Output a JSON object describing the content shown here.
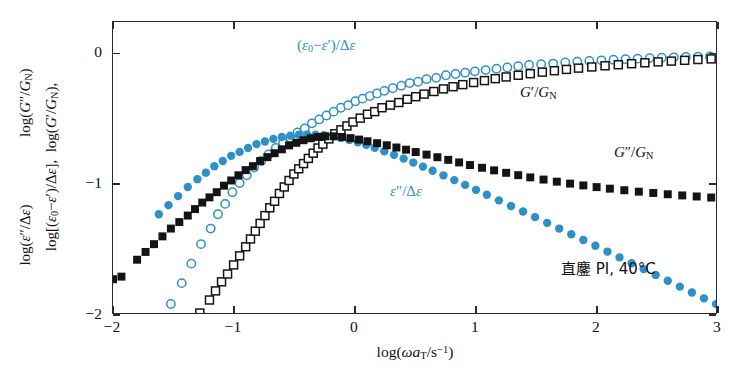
{
  "figure": {
    "background": "#ffffff",
    "accent_blue": "#2e90c8",
    "accent_black": "#141414"
  },
  "axes": {
    "x": {
      "title_html": "log(&#969;<i>a</i><sub>T</sub>/s<sup>&#8722;1</sup>)",
      "title_text": "log(ωa_T/s^-1)",
      "ticks": [
        "-2",
        "-1",
        "0",
        "1",
        "2",
        "3"
      ],
      "tick_values": [
        -2,
        -1,
        0,
        1,
        2,
        3
      ],
      "min": -2,
      "max": 3
    },
    "y": {
      "line1_text": "log[(ε₀−ε′)/Δε],  log(G′/G_N)",
      "line2_text": "log(ε″/Δε),  log(G″/G_N)",
      "ticks": [
        "0",
        "-1",
        "-2"
      ],
      "tick_values": [
        0,
        -1,
        -2
      ],
      "min": -2,
      "max": 0.24
    }
  },
  "annotations": {
    "eps_real": "(ε₀−ε′)/Δε",
    "eps_imag": "ε″/Δε",
    "g_prime": "G′/G_N",
    "g_dprime": "G″/G_N",
    "sample": "直鏖 PI, 40°C"
  },
  "chart_data": {
    "type": "scatter",
    "title": "",
    "xlabel": "log(ωa_T/s^-1)",
    "ylabel": "log[(ε₀−ε′)/Δε], log(G′/G_N), log(ε″/Δε), log(G″/G_N)",
    "xlim": [
      -2,
      3
    ],
    "ylim": [
      -2,
      0.24
    ],
    "grid": false,
    "legend": "inline-annotations",
    "marker_px": 8,
    "series": [
      {
        "name": "(ε₀−ε′)/Δε",
        "label": "eps-real",
        "marker": "open-circle",
        "color": "#2e90c8",
        "points": [
          [
            -1.52,
            -1.93
          ],
          [
            -1.43,
            -1.77
          ],
          [
            -1.35,
            -1.62
          ],
          [
            -1.27,
            -1.47
          ],
          [
            -1.19,
            -1.35
          ],
          [
            -1.13,
            -1.24
          ],
          [
            -1.07,
            -1.16
          ],
          [
            -1.01,
            -1.07
          ],
          [
            -0.95,
            -1.0
          ],
          [
            -0.89,
            -0.94
          ],
          [
            -0.83,
            -0.88
          ],
          [
            -0.77,
            -0.83
          ],
          [
            -0.71,
            -0.78
          ],
          [
            -0.65,
            -0.73
          ],
          [
            -0.59,
            -0.69
          ],
          [
            -0.53,
            -0.65
          ],
          [
            -0.47,
            -0.61
          ],
          [
            -0.41,
            -0.58
          ],
          [
            -0.35,
            -0.54
          ],
          [
            -0.29,
            -0.51
          ],
          [
            -0.23,
            -0.48
          ],
          [
            -0.17,
            -0.45
          ],
          [
            -0.11,
            -0.42
          ],
          [
            -0.05,
            -0.4
          ],
          [
            0.01,
            -0.37
          ],
          [
            0.07,
            -0.35
          ],
          [
            0.13,
            -0.33
          ],
          [
            0.19,
            -0.31
          ],
          [
            0.25,
            -0.29
          ],
          [
            0.32,
            -0.27
          ],
          [
            0.39,
            -0.25
          ],
          [
            0.46,
            -0.23
          ],
          [
            0.53,
            -0.22
          ],
          [
            0.6,
            -0.2
          ],
          [
            0.68,
            -0.19
          ],
          [
            0.76,
            -0.17
          ],
          [
            0.84,
            -0.16
          ],
          [
            0.92,
            -0.15
          ],
          [
            1.0,
            -0.14
          ],
          [
            1.09,
            -0.13
          ],
          [
            1.18,
            -0.12
          ],
          [
            1.27,
            -0.11
          ],
          [
            1.36,
            -0.1
          ],
          [
            1.45,
            -0.09
          ],
          [
            1.55,
            -0.085
          ],
          [
            1.65,
            -0.08
          ],
          [
            1.75,
            -0.072
          ],
          [
            1.85,
            -0.066
          ],
          [
            1.95,
            -0.06
          ],
          [
            2.05,
            -0.055
          ],
          [
            2.15,
            -0.05
          ],
          [
            2.25,
            -0.046
          ],
          [
            2.35,
            -0.042
          ],
          [
            2.45,
            -0.038
          ],
          [
            2.55,
            -0.035
          ],
          [
            2.65,
            -0.032
          ],
          [
            2.75,
            -0.029
          ],
          [
            2.85,
            -0.027
          ],
          [
            2.95,
            -0.025
          ]
        ]
      },
      {
        "name": "ε″/Δε",
        "label": "eps-imag",
        "marker": "filled-circle",
        "color": "#2e90c8",
        "points": [
          [
            -1.62,
            -1.24
          ],
          [
            -1.54,
            -1.17
          ],
          [
            -1.46,
            -1.1
          ],
          [
            -1.38,
            -1.03
          ],
          [
            -1.3,
            -0.97
          ],
          [
            -1.23,
            -0.92
          ],
          [
            -1.16,
            -0.87
          ],
          [
            -1.09,
            -0.83
          ],
          [
            -1.02,
            -0.79
          ],
          [
            -0.95,
            -0.76
          ],
          [
            -0.88,
            -0.73
          ],
          [
            -0.81,
            -0.7
          ],
          [
            -0.74,
            -0.68
          ],
          [
            -0.67,
            -0.66
          ],
          [
            -0.6,
            -0.645
          ],
          [
            -0.53,
            -0.635
          ],
          [
            -0.46,
            -0.628
          ],
          [
            -0.39,
            -0.625
          ],
          [
            -0.32,
            -0.627
          ],
          [
            -0.25,
            -0.632
          ],
          [
            -0.18,
            -0.641
          ],
          [
            -0.11,
            -0.653
          ],
          [
            -0.04,
            -0.668
          ],
          [
            0.03,
            -0.686
          ],
          [
            0.1,
            -0.706
          ],
          [
            0.17,
            -0.728
          ],
          [
            0.25,
            -0.755
          ],
          [
            0.33,
            -0.783
          ],
          [
            0.41,
            -0.812
          ],
          [
            0.49,
            -0.842
          ],
          [
            0.57,
            -0.873
          ],
          [
            0.65,
            -0.905
          ],
          [
            0.74,
            -0.94
          ],
          [
            0.83,
            -0.977
          ],
          [
            0.92,
            -1.014
          ],
          [
            1.01,
            -1.052
          ],
          [
            1.1,
            -1.09
          ],
          [
            1.2,
            -1.133
          ],
          [
            1.3,
            -1.176
          ],
          [
            1.4,
            -1.219
          ],
          [
            1.5,
            -1.262
          ],
          [
            1.6,
            -1.306
          ],
          [
            1.7,
            -1.35
          ],
          [
            1.8,
            -1.394
          ],
          [
            1.9,
            -1.438
          ],
          [
            2.0,
            -1.482
          ],
          [
            2.1,
            -1.527
          ],
          [
            2.2,
            -1.572
          ],
          [
            2.3,
            -1.617
          ],
          [
            2.4,
            -1.662
          ],
          [
            2.5,
            -1.707
          ],
          [
            2.6,
            -1.752
          ],
          [
            2.7,
            -1.797
          ],
          [
            2.8,
            -1.842
          ],
          [
            2.9,
            -1.887
          ],
          [
            3.0,
            -1.932
          ]
        ]
      },
      {
        "name": "G′/G_N",
        "label": "g-prime",
        "marker": "open-square",
        "color": "#141414",
        "points": [
          [
            -1.28,
            -2.0
          ],
          [
            -1.2,
            -1.9
          ],
          [
            -1.15,
            -1.83
          ],
          [
            -1.1,
            -1.76
          ],
          [
            -1.05,
            -1.7
          ],
          [
            -1.0,
            -1.63
          ],
          [
            -0.95,
            -1.56
          ],
          [
            -0.9,
            -1.49
          ],
          [
            -0.86,
            -1.43
          ],
          [
            -0.82,
            -1.37
          ],
          [
            -0.78,
            -1.31
          ],
          [
            -0.74,
            -1.25
          ],
          [
            -0.7,
            -1.19
          ],
          [
            -0.66,
            -1.14
          ],
          [
            -0.62,
            -1.08
          ],
          [
            -0.58,
            -1.03
          ],
          [
            -0.54,
            -0.98
          ],
          [
            -0.5,
            -0.93
          ],
          [
            -0.46,
            -0.89
          ],
          [
            -0.42,
            -0.85
          ],
          [
            -0.38,
            -0.81
          ],
          [
            -0.34,
            -0.77
          ],
          [
            -0.3,
            -0.73
          ],
          [
            -0.26,
            -0.7
          ],
          [
            -0.21,
            -0.66
          ],
          [
            -0.16,
            -0.62
          ],
          [
            -0.11,
            -0.59
          ],
          [
            -0.06,
            -0.56
          ],
          [
            -0.01,
            -0.53
          ],
          [
            0.05,
            -0.5
          ],
          [
            0.11,
            -0.47
          ],
          [
            0.17,
            -0.45
          ],
          [
            0.23,
            -0.42
          ],
          [
            0.3,
            -0.4
          ],
          [
            0.37,
            -0.38
          ],
          [
            0.44,
            -0.355
          ],
          [
            0.51,
            -0.335
          ],
          [
            0.58,
            -0.315
          ],
          [
            0.66,
            -0.295
          ],
          [
            0.74,
            -0.275
          ],
          [
            0.82,
            -0.258
          ],
          [
            0.9,
            -0.242
          ],
          [
            0.99,
            -0.226
          ],
          [
            1.08,
            -0.211
          ],
          [
            1.17,
            -0.196
          ],
          [
            1.26,
            -0.183
          ],
          [
            1.36,
            -0.17
          ],
          [
            1.46,
            -0.158
          ],
          [
            1.56,
            -0.146
          ],
          [
            1.66,
            -0.135
          ],
          [
            1.76,
            -0.125
          ],
          [
            1.86,
            -0.115
          ],
          [
            1.97,
            -0.106
          ],
          [
            2.08,
            -0.097
          ],
          [
            2.19,
            -0.089
          ],
          [
            2.3,
            -0.081
          ],
          [
            2.41,
            -0.074
          ],
          [
            2.52,
            -0.067
          ],
          [
            2.63,
            -0.061
          ],
          [
            2.74,
            -0.055
          ],
          [
            2.85,
            -0.049
          ],
          [
            2.96,
            -0.044
          ]
        ]
      },
      {
        "name": "G″/G_N",
        "label": "g-dprime",
        "marker": "filled-square",
        "color": "#141414",
        "points": [
          [
            -2.0,
            -1.74
          ],
          [
            -1.93,
            -1.72
          ],
          [
            -1.8,
            -1.59
          ],
          [
            -1.73,
            -1.53
          ],
          [
            -1.66,
            -1.47
          ],
          [
            -1.59,
            -1.41
          ],
          [
            -1.52,
            -1.35
          ],
          [
            -1.45,
            -1.3
          ],
          [
            -1.38,
            -1.25
          ],
          [
            -1.32,
            -1.2
          ],
          [
            -1.26,
            -1.15
          ],
          [
            -1.2,
            -1.11
          ],
          [
            -1.14,
            -1.07
          ],
          [
            -1.08,
            -1.02
          ],
          [
            -1.02,
            -0.98
          ],
          [
            -0.96,
            -0.94
          ],
          [
            -0.9,
            -0.9
          ],
          [
            -0.84,
            -0.87
          ],
          [
            -0.78,
            -0.83
          ],
          [
            -0.72,
            -0.8
          ],
          [
            -0.66,
            -0.77
          ],
          [
            -0.6,
            -0.74
          ],
          [
            -0.54,
            -0.71
          ],
          [
            -0.48,
            -0.69
          ],
          [
            -0.42,
            -0.67
          ],
          [
            -0.36,
            -0.655
          ],
          [
            -0.3,
            -0.645
          ],
          [
            -0.24,
            -0.64
          ],
          [
            -0.17,
            -0.64
          ],
          [
            -0.1,
            -0.645
          ],
          [
            -0.03,
            -0.654
          ],
          [
            0.04,
            -0.665
          ],
          [
            0.11,
            -0.678
          ],
          [
            0.19,
            -0.693
          ],
          [
            0.27,
            -0.709
          ],
          [
            0.35,
            -0.726
          ],
          [
            0.43,
            -0.743
          ],
          [
            0.51,
            -0.761
          ],
          [
            0.6,
            -0.781
          ],
          [
            0.69,
            -0.801
          ],
          [
            0.78,
            -0.821
          ],
          [
            0.87,
            -0.841
          ],
          [
            0.96,
            -0.861
          ],
          [
            1.06,
            -0.882
          ],
          [
            1.16,
            -0.902
          ],
          [
            1.26,
            -0.921
          ],
          [
            1.36,
            -0.939
          ],
          [
            1.46,
            -0.956
          ],
          [
            1.57,
            -0.973
          ],
          [
            1.68,
            -0.989
          ],
          [
            1.79,
            -1.004
          ],
          [
            1.9,
            -1.018
          ],
          [
            2.01,
            -1.031
          ],
          [
            2.12,
            -1.043
          ],
          [
            2.24,
            -1.055
          ],
          [
            2.36,
            -1.066
          ],
          [
            2.48,
            -1.076
          ],
          [
            2.6,
            -1.086
          ],
          [
            2.72,
            -1.095
          ],
          [
            2.84,
            -1.103
          ],
          [
            2.96,
            -1.111
          ]
        ]
      }
    ]
  }
}
